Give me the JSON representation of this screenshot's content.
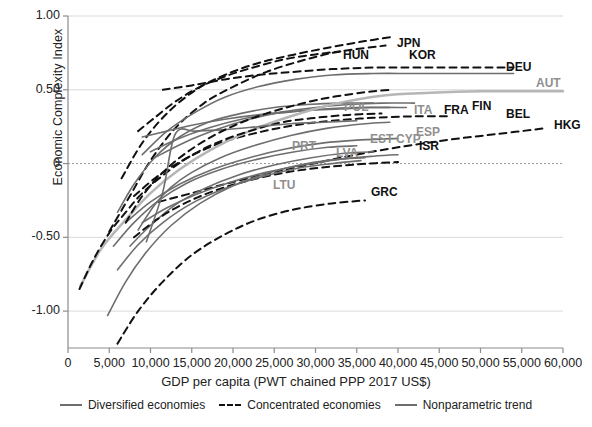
{
  "chart_data": {
    "type": "line",
    "title": "",
    "xlabel": "GDP per capita (PWT chained PPP 2017 US$)",
    "ylabel": "Economic Complexity Index",
    "xlim": [
      0,
      60000
    ],
    "ylim": [
      -1.25,
      1.0
    ],
    "xticks": [
      "0",
      "5,000",
      "10,000",
      "15,000",
      "20,000",
      "25,000",
      "30,000",
      "35,000",
      "40,000",
      "45,000",
      "50,000",
      "55,000",
      "60,000"
    ],
    "yticks": [
      "1.00",
      "0.50",
      "0",
      "-0.50",
      "-1.00"
    ],
    "grid": "horizontal",
    "zero_line": true,
    "legend_position": "bottom",
    "legend": [
      {
        "label": "Diversified economies",
        "style": "solid",
        "color": "#6e6e6e"
      },
      {
        "label": "Concentrated economies",
        "style": "dashed",
        "color": "#111111"
      },
      {
        "label": "Nonparametric trend",
        "style": "solid",
        "color": "#b6b6b6"
      }
    ],
    "series": [
      {
        "name": "JPN",
        "style": "dashed",
        "label_xy": [
          397,
          36
        ],
        "points": [
          [
            6500,
            -0.1
          ],
          [
            9000,
            0.14
          ],
          [
            12000,
            0.34
          ],
          [
            15500,
            0.5
          ],
          [
            19000,
            0.6
          ],
          [
            23000,
            0.68
          ],
          [
            27500,
            0.74
          ],
          [
            32000,
            0.79
          ],
          [
            36000,
            0.83
          ],
          [
            39500,
            0.86
          ]
        ]
      },
      {
        "name": "KOR",
        "style": "dashed",
        "label_xy": [
          409,
          48
        ],
        "points": [
          [
            5000,
            -0.46
          ],
          [
            7500,
            -0.22
          ],
          [
            10000,
            0.02
          ],
          [
            13000,
            0.24
          ],
          [
            16500,
            0.41
          ],
          [
            20000,
            0.52
          ],
          [
            24000,
            0.62
          ],
          [
            28500,
            0.7
          ],
          [
            33000,
            0.76
          ],
          [
            38500,
            0.8
          ]
        ]
      },
      {
        "name": "HUN",
        "style": "dashed",
        "label_xy": [
          343,
          48
        ],
        "points": [
          [
            8500,
            0.22
          ],
          [
            10500,
            0.31
          ],
          [
            13000,
            0.42
          ],
          [
            16000,
            0.52
          ],
          [
            19500,
            0.6
          ],
          [
            23000,
            0.66
          ],
          [
            26500,
            0.71
          ],
          [
            30000,
            0.74
          ],
          [
            33000,
            0.76
          ]
        ]
      },
      {
        "name": "DEU",
        "style": "dashed",
        "label_xy": [
          506,
          60
        ],
        "points": [
          [
            11500,
            0.5
          ],
          [
            15000,
            0.53
          ],
          [
            19000,
            0.57
          ],
          [
            23000,
            0.6
          ],
          [
            27000,
            0.62
          ],
          [
            32000,
            0.64
          ],
          [
            37000,
            0.65
          ],
          [
            42000,
            0.65
          ],
          [
            48000,
            0.65
          ],
          [
            54000,
            0.65
          ]
        ]
      },
      {
        "name": "AUT",
        "style": "solid",
        "label_xy": [
          536,
          76
        ],
        "points": [
          [
            9000,
            0.06
          ],
          [
            12000,
            0.22
          ],
          [
            15500,
            0.35
          ],
          [
            19000,
            0.45
          ],
          [
            23000,
            0.52
          ],
          [
            27500,
            0.57
          ],
          [
            32000,
            0.6
          ],
          [
            37000,
            0.61
          ],
          [
            42000,
            0.61
          ],
          [
            48000,
            0.61
          ],
          [
            54000,
            0.61
          ]
        ]
      },
      {
        "name": "POL",
        "style": "solid",
        "label_xy": [
          344,
          100
        ],
        "points": [
          [
            6000,
            -0.33
          ],
          [
            8000,
            -0.14
          ],
          [
            10500,
            0.04
          ],
          [
            13500,
            0.18
          ],
          [
            17000,
            0.28
          ],
          [
            21000,
            0.34
          ],
          [
            25000,
            0.38
          ],
          [
            29000,
            0.4
          ],
          [
            33000,
            0.41
          ],
          [
            37000,
            0.41
          ]
        ]
      },
      {
        "name": "ITA",
        "style": "solid",
        "label_xy": [
          414,
          103
        ],
        "points": [
          [
            9000,
            0.18
          ],
          [
            12000,
            0.22
          ],
          [
            15000,
            0.26
          ],
          [
            19000,
            0.3
          ],
          [
            23000,
            0.33
          ],
          [
            27000,
            0.35
          ],
          [
            31000,
            0.37
          ],
          [
            35000,
            0.38
          ],
          [
            39000,
            0.38
          ]
        ]
      },
      {
        "name": "FRA",
        "style": "solid",
        "label_xy": [
          444,
          103
        ],
        "points": [
          [
            10000,
            0.08
          ],
          [
            13000,
            0.16
          ],
          [
            17000,
            0.24
          ],
          [
            21000,
            0.3
          ],
          [
            25000,
            0.34
          ],
          [
            29000,
            0.36
          ],
          [
            33000,
            0.37
          ],
          [
            37000,
            0.38
          ],
          [
            41000,
            0.38
          ]
        ]
      },
      {
        "name": "FIN",
        "style": "solid",
        "label_xy": [
          472,
          99
        ],
        "points": [
          [
            10500,
            0.04
          ],
          [
            14000,
            0.14
          ],
          [
            18000,
            0.23
          ],
          [
            22000,
            0.3
          ],
          [
            26000,
            0.35
          ],
          [
            30000,
            0.38
          ],
          [
            34000,
            0.4
          ],
          [
            38000,
            0.41
          ],
          [
            42000,
            0.41
          ]
        ]
      },
      {
        "name": "BEL",
        "style": "dashed",
        "label_xy": [
          506,
          107
        ],
        "points": [
          [
            8000,
            -0.22
          ],
          [
            11000,
            -0.08
          ],
          [
            14500,
            0.04
          ],
          [
            18500,
            0.14
          ],
          [
            23000,
            0.21
          ],
          [
            27500,
            0.26
          ],
          [
            32000,
            0.29
          ],
          [
            37000,
            0.31
          ],
          [
            42000,
            0.32
          ],
          [
            46000,
            0.32
          ]
        ]
      },
      {
        "name": "HKG",
        "style": "dashed",
        "label_xy": [
          554,
          118
        ],
        "points": [
          [
            11000,
            -0.26
          ],
          [
            15000,
            -0.2
          ],
          [
            19000,
            -0.14
          ],
          [
            24000,
            -0.07
          ],
          [
            29000,
            -0.01
          ],
          [
            34000,
            0.05
          ],
          [
            40000,
            0.11
          ],
          [
            46000,
            0.16
          ],
          [
            52000,
            0.2
          ],
          [
            58000,
            0.24
          ]
        ]
      },
      {
        "name": "ESP",
        "style": "solid",
        "label_xy": [
          416,
          125
        ],
        "points": [
          [
            7000,
            -0.4
          ],
          [
            10000,
            -0.26
          ],
          [
            13500,
            -0.14
          ],
          [
            17500,
            -0.04
          ],
          [
            22000,
            0.04
          ],
          [
            26500,
            0.1
          ],
          [
            31000,
            0.14
          ],
          [
            35500,
            0.16
          ],
          [
            40000,
            0.17
          ]
        ]
      },
      {
        "name": "CYP",
        "style": "solid",
        "label_xy": [
          396,
          132
        ],
        "points": [
          [
            9000,
            -0.4
          ],
          [
            12000,
            -0.3
          ],
          [
            15500,
            -0.21
          ],
          [
            19500,
            -0.13
          ],
          [
            24000,
            -0.06
          ],
          [
            28500,
            -0.01
          ],
          [
            33000,
            0.03
          ],
          [
            37000,
            0.05
          ],
          [
            40000,
            0.06
          ]
        ]
      },
      {
        "name": "EST",
        "style": "solid",
        "label_xy": [
          370,
          132
        ],
        "points": [
          [
            7500,
            -0.56
          ],
          [
            10000,
            -0.42
          ],
          [
            13000,
            -0.28
          ],
          [
            16500,
            -0.17
          ],
          [
            20500,
            -0.08
          ],
          [
            25000,
            -0.01
          ],
          [
            29500,
            0.04
          ],
          [
            33500,
            0.07
          ],
          [
            37000,
            0.08
          ]
        ]
      },
      {
        "name": "ISR",
        "style": "dashed",
        "label_xy": [
          419,
          139
        ],
        "points": [
          [
            8000,
            -0.5
          ],
          [
            11000,
            -0.37
          ],
          [
            14500,
            -0.26
          ],
          [
            18500,
            -0.17
          ],
          [
            23000,
            -0.1
          ],
          [
            27500,
            -0.05
          ],
          [
            32000,
            -0.02
          ],
          [
            36500,
            0.0
          ],
          [
            40000,
            0.01
          ]
        ]
      },
      {
        "name": "PRT",
        "style": "solid",
        "label_xy": [
          292,
          139
        ],
        "points": [
          [
            5500,
            -0.56
          ],
          [
            8000,
            -0.4
          ],
          [
            11000,
            -0.25
          ],
          [
            14500,
            -0.13
          ],
          [
            18500,
            -0.04
          ],
          [
            23000,
            0.03
          ],
          [
            27500,
            0.08
          ],
          [
            31500,
            0.11
          ],
          [
            35000,
            0.12
          ]
        ]
      },
      {
        "name": "LVA",
        "style": "solid",
        "label_xy": [
          336,
          146
        ],
        "points": [
          [
            6000,
            -0.72
          ],
          [
            8500,
            -0.55
          ],
          [
            11500,
            -0.4
          ],
          [
            15000,
            -0.27
          ],
          [
            19000,
            -0.17
          ],
          [
            23500,
            -0.09
          ],
          [
            28000,
            -0.03
          ],
          [
            32000,
            0.0
          ],
          [
            35500,
            0.02
          ]
        ]
      },
      {
        "name": "LTU",
        "style": "solid",
        "label_xy": [
          273,
          178
        ],
        "points": [
          [
            4800,
            -1.03
          ],
          [
            7000,
            -0.8
          ],
          [
            9500,
            -0.6
          ],
          [
            12500,
            -0.42
          ],
          [
            16000,
            -0.27
          ],
          [
            20000,
            -0.15
          ],
          [
            24500,
            -0.06
          ],
          [
            29000,
            0.0
          ],
          [
            33000,
            0.03
          ],
          [
            36000,
            0.04
          ]
        ]
      },
      {
        "name": "GRC",
        "style": "dashed",
        "label_xy": [
          371,
          185
        ],
        "points": [
          [
            6000,
            -1.22
          ],
          [
            8500,
            -1.0
          ],
          [
            11500,
            -0.8
          ],
          [
            15000,
            -0.62
          ],
          [
            19000,
            -0.48
          ],
          [
            23000,
            -0.38
          ],
          [
            27500,
            -0.31
          ],
          [
            32000,
            -0.27
          ],
          [
            36000,
            -0.25
          ]
        ]
      },
      {
        "name": "Nonparametric trend",
        "style": "light",
        "label_xy": null,
        "points": [
          [
            1500,
            -0.83
          ],
          [
            4000,
            -0.58
          ],
          [
            7000,
            -0.38
          ],
          [
            10000,
            -0.2
          ],
          [
            13500,
            -0.04
          ],
          [
            17500,
            0.1
          ],
          [
            22000,
            0.22
          ],
          [
            27000,
            0.32
          ],
          [
            32000,
            0.4
          ],
          [
            38000,
            0.46
          ],
          [
            44000,
            0.48
          ],
          [
            50000,
            0.49
          ],
          [
            56000,
            0.49
          ],
          [
            60000,
            0.49
          ]
        ]
      },
      {
        "name": "dashed-low-start",
        "style": "dashed",
        "label_xy": null,
        "points": [
          [
            1400,
            -0.85
          ],
          [
            3000,
            -0.66
          ],
          [
            5000,
            -0.47
          ],
          [
            7000,
            -0.33
          ],
          [
            9000,
            -0.2
          ],
          [
            11500,
            -0.08
          ],
          [
            14500,
            0.04
          ],
          [
            18000,
            0.14
          ],
          [
            22000,
            0.22
          ],
          [
            26000,
            0.28
          ],
          [
            30000,
            0.31
          ],
          [
            34000,
            0.33
          ],
          [
            38000,
            0.34
          ]
        ]
      },
      {
        "name": "solid-mid-a",
        "style": "solid",
        "label_xy": null,
        "points": [
          [
            8500,
            -0.45
          ],
          [
            10500,
            -0.28
          ],
          [
            12500,
            -0.16
          ],
          [
            15000,
            -0.06
          ],
          [
            18500,
            0.04
          ],
          [
            22500,
            0.12
          ],
          [
            27000,
            0.19
          ],
          [
            31500,
            0.24
          ],
          [
            36000,
            0.27
          ],
          [
            39000,
            0.28
          ]
        ]
      },
      {
        "name": "solid-mid-b",
        "style": "solid",
        "label_xy": null,
        "points": [
          [
            9500,
            -0.53
          ],
          [
            11500,
            -0.19
          ],
          [
            13000,
            0.2
          ],
          [
            15500,
            0.22
          ],
          [
            19000,
            0.23
          ],
          [
            23000,
            0.25
          ],
          [
            27000,
            0.27
          ],
          [
            31000,
            0.28
          ],
          [
            35000,
            0.29
          ]
        ]
      },
      {
        "name": "dashed-mid-a",
        "style": "dashed",
        "label_xy": null,
        "points": [
          [
            7000,
            -0.4
          ],
          [
            9000,
            -0.22
          ],
          [
            11500,
            -0.06
          ],
          [
            14500,
            0.08
          ],
          [
            18000,
            0.2
          ],
          [
            22000,
            0.3
          ],
          [
            26500,
            0.38
          ],
          [
            31000,
            0.44
          ],
          [
            35500,
            0.48
          ],
          [
            39000,
            0.5
          ]
        ]
      }
    ]
  },
  "axes": {
    "y_title": "Economic Complexity Index",
    "x_title": "GDP per capita (PWT chained PPP 2017 US$)"
  },
  "colors": {
    "diversified": "#6e6e6e",
    "concentrated": "#111111",
    "trend": "#b6b6b6",
    "grid": "#d9d9d9",
    "axis": "#8c8c8c"
  }
}
